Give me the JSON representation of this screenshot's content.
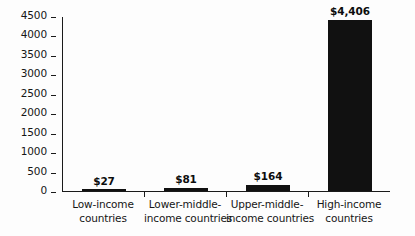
{
  "chart_data": {
    "type": "bar",
    "title": "",
    "xlabel": "",
    "ylabel": "",
    "ylim": [
      0,
      4500
    ],
    "ytick_step": 500,
    "grid": false,
    "legend": false,
    "bar_color": "#111111",
    "axis_color": "#1a1a1a",
    "background": "#fdfdfd",
    "categories": [
      "Low-income countries",
      "Lower-middle-income countries",
      "Upper-middle-income countries",
      "High-income countries"
    ],
    "category_lines": [
      [
        "Low-income",
        "countries"
      ],
      [
        "Lower-middle-",
        "income countries"
      ],
      [
        "Upper-middle-",
        "income countries"
      ],
      [
        "High-income",
        "countries"
      ]
    ],
    "values": [
      27,
      81,
      164,
      4406
    ],
    "value_labels": [
      "$27",
      "$81",
      "$164",
      "$4,406"
    ],
    "ytick_labels": [
      "0",
      "500",
      "1000",
      "1500",
      "2000",
      "2500",
      "3000",
      "3500",
      "4000",
      "4500"
    ],
    "ytick_values": [
      0,
      500,
      1000,
      1500,
      2000,
      2500,
      3000,
      3500,
      4000,
      4500
    ]
  }
}
